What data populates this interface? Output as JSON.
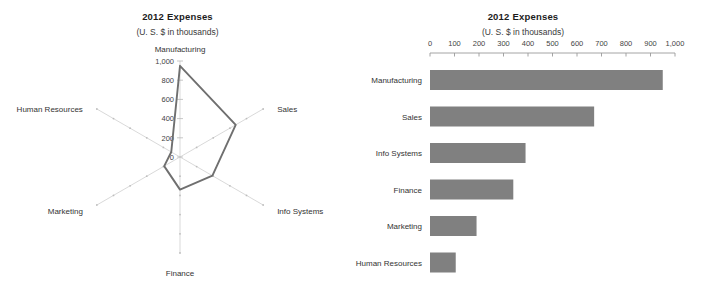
{
  "radar": {
    "title": "2012 Expenses",
    "subtitle": "(U. S. $ in thousands)",
    "axis_ticks": [
      "0",
      "200",
      "400",
      "600",
      "800",
      "1,000"
    ],
    "category_labels": {
      "manufacturing": "Manufacturing",
      "sales": "Sales",
      "info_systems": "Info Systems",
      "finance": "Finance",
      "marketing": "Marketing",
      "human_resources": "Human Resources"
    }
  },
  "bar": {
    "title": "2012 Expenses",
    "subtitle": "(U. S. $ in thousands)",
    "axis_ticks": [
      "0",
      "100",
      "200",
      "300",
      "400",
      "500",
      "600",
      "700",
      "800",
      "900",
      "1,000"
    ],
    "category_labels": {
      "manufacturing": "Manufacturing",
      "sales": "Sales",
      "info_systems": "Info Systems",
      "finance": "Finance",
      "marketing": "Marketing",
      "human_resources": "Human Resources"
    }
  },
  "chart_data": [
    {
      "type": "line",
      "variant": "radar",
      "title": "2012 Expenses",
      "subtitle": "(U. S. $ in thousands)",
      "xlabel": "",
      "ylabel": "",
      "categories": [
        "Manufacturing",
        "Sales",
        "Info Systems",
        "Finance",
        "Marketing",
        "Human Resources"
      ],
      "values": [
        950,
        670,
        390,
        340,
        190,
        105
      ],
      "ylim": [
        0,
        1000
      ],
      "yticks": [
        0,
        200,
        400,
        600,
        800,
        1000
      ],
      "ytick_labels": [
        "0",
        "200",
        "400",
        "600",
        "800",
        "1,000"
      ],
      "grid": true,
      "legend": "none",
      "series_color": "#6f6f6f",
      "grid_color": "#cfcfcf"
    },
    {
      "type": "bar",
      "variant": "horizontal",
      "title": "2012 Expenses",
      "subtitle": "(U. S. $ in thousands)",
      "xlabel": "",
      "ylabel": "",
      "categories": [
        "Manufacturing",
        "Sales",
        "Info Systems",
        "Finance",
        "Marketing",
        "Human Resources"
      ],
      "values": [
        950,
        670,
        390,
        340,
        190,
        105
      ],
      "xlim": [
        0,
        1000
      ],
      "xticks": [
        0,
        100,
        200,
        300,
        400,
        500,
        600,
        700,
        800,
        900,
        1000
      ],
      "xtick_labels": [
        "0",
        "100",
        "200",
        "300",
        "400",
        "500",
        "600",
        "700",
        "800",
        "900",
        "1,000"
      ],
      "grid": false,
      "legend": "none",
      "bar_color": "#808080",
      "axis_color": "#9a9a9a"
    }
  ]
}
